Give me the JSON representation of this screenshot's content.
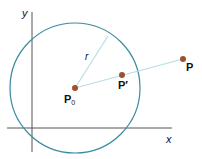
{
  "diagram": {
    "axes": {
      "x_label": "x",
      "y_label": "y"
    },
    "circle": {
      "center_label": "P",
      "center_subscript": "0",
      "radius_label": "r"
    },
    "points": {
      "p_label": "P",
      "p_prime_label": "P′"
    },
    "colors": {
      "circle": "#3a8aa0",
      "segment": "#b8dce6",
      "point": "#a0522d",
      "axis": "#555555"
    }
  }
}
